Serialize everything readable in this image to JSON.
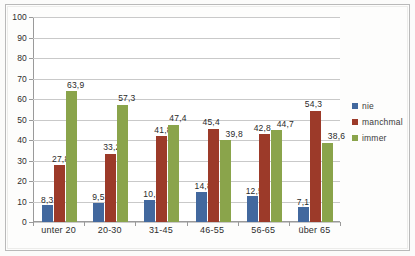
{
  "chart_data": {
    "type": "bar",
    "title": "",
    "subtitle": "",
    "xlabel": "",
    "ylabel": "",
    "ylim": [
      0,
      100
    ],
    "ytick_step": 10,
    "yticks": [
      "100",
      "90",
      "80",
      "70",
      "60",
      "50",
      "40",
      "30",
      "20",
      "10",
      "0"
    ],
    "grid": true,
    "legend_position": "right",
    "decimal_separator": ",",
    "categories": [
      "unter 20",
      "20-30",
      "31-45",
      "46-55",
      "56-65",
      "über 65"
    ],
    "series": [
      {
        "name": "nie",
        "color": "#42689E",
        "values": [
          8.3,
          9.5,
          10.8,
          14.8,
          12.5,
          7.1
        ],
        "labels": [
          "8,3",
          "9,5",
          "10,8",
          "14,8",
          "12,5",
          "7,1"
        ]
      },
      {
        "name": "manchmal",
        "color": "#9C3A29",
        "values": [
          27.8,
          33.2,
          41.8,
          45.4,
          42.8,
          54.3
        ],
        "labels": [
          "27,8",
          "33,2",
          "41,8",
          "45,4",
          "42,8",
          "54,3"
        ]
      },
      {
        "name": "immer",
        "color": "#8AA44B",
        "values": [
          63.9,
          57.3,
          47.4,
          39.8,
          44.7,
          38.6
        ],
        "labels": [
          "63,9",
          "57,3",
          "47,4",
          "39,8",
          "44,7",
          "38,6"
        ]
      }
    ]
  },
  "legend": {
    "items": [
      {
        "label": "nie",
        "color": "#42689E"
      },
      {
        "label": "manchmal",
        "color": "#9C3A29"
      },
      {
        "label": "immer",
        "color": "#8AA44B"
      }
    ]
  }
}
